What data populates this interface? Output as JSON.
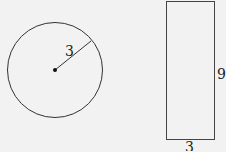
{
  "circle": {
    "radius_label": "3",
    "stroke": "#333333"
  },
  "rectangle": {
    "height_label": "9",
    "width_label": "3",
    "stroke": "#444444"
  },
  "background": "#f2f2f2"
}
